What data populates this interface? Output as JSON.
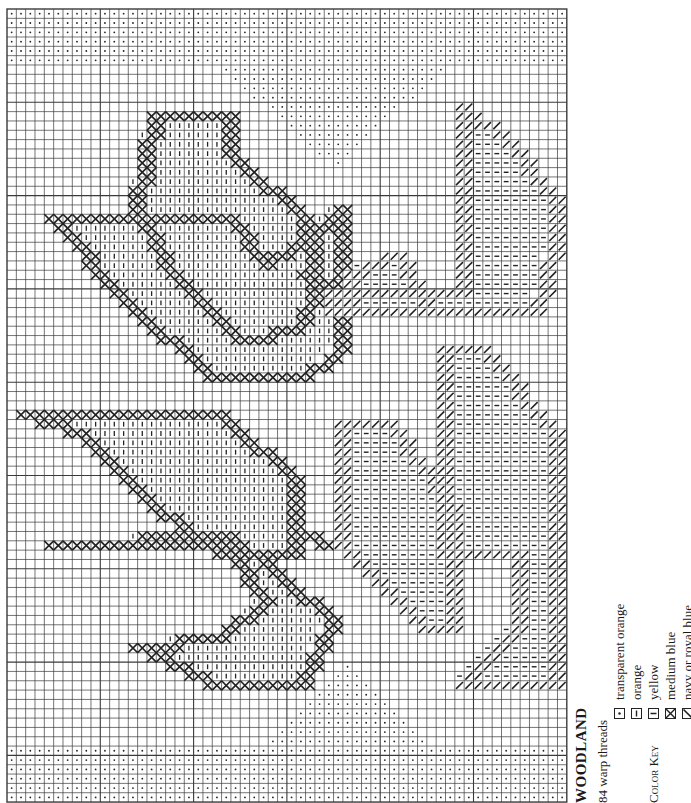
{
  "pattern": {
    "title": "WOODLAND",
    "warp_threads": "84 warp threads",
    "color_key_label": "Color Key",
    "key": [
      {
        "symbol": "dot",
        "label": "transparent orange"
      },
      {
        "symbol": "hbar",
        "label": "orange"
      },
      {
        "symbol": "vbar",
        "label": "yellow"
      },
      {
        "symbol": "cross",
        "label": "medium blue"
      },
      {
        "symbol": "slash",
        "label": "navy or royal blue"
      }
    ]
  },
  "grid": {
    "origin_x": 7,
    "origin_y": 9,
    "cell": 9.33,
    "cols": 60,
    "rows": 85,
    "line_color": "#3a3a3a",
    "ink_color": "#222222"
  },
  "regions": [
    {
      "symbol": "dot",
      "rows": [
        0,
        5
      ],
      "cols": [
        0,
        59
      ]
    },
    {
      "symbol": "dot",
      "rows": [
        79,
        84
      ],
      "cols": [
        0,
        59
      ]
    },
    {
      "symbol": "dot",
      "tri": "down",
      "top_row": 6,
      "apex_row": 16,
      "col_from": 23,
      "col_to": 46
    },
    {
      "symbol": "dot",
      "tri": "up",
      "bottom_row": 78,
      "apex_row": 70,
      "col_from": 28,
      "col_to": 44
    }
  ],
  "shapes": {
    "upper_leaves": [
      {
        "outline": [
          [
            11,
            16
          ],
          [
            11,
            22
          ],
          [
            16,
            24
          ],
          [
            20,
            29
          ],
          [
            17,
            33
          ],
          [
            25,
            32
          ],
          [
            27,
            34
          ],
          [
            29,
            33
          ],
          [
            37,
            32
          ],
          [
            37,
            26
          ],
          [
            31,
            22
          ],
          [
            22,
            13
          ]
        ],
        "fill": "vbar"
      },
      {
        "outline": [
          [
            22,
            5
          ],
          [
            22,
            15
          ],
          [
            27,
            19
          ],
          [
            31,
            13
          ],
          [
            35,
            6
          ],
          [
            38,
            2
          ],
          [
            38,
            20
          ],
          [
            33,
            24
          ],
          [
            29,
            33
          ]
        ],
        "fill": "vbar"
      }
    ]
  }
}
